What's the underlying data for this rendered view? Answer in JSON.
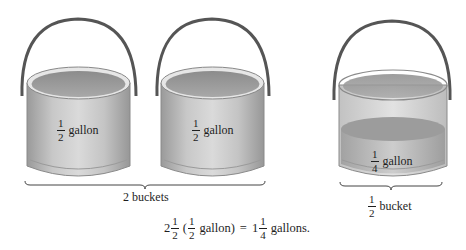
{
  "figure": {
    "buckets": [
      {
        "id": "bucket-1",
        "label": {
          "numerator": "1",
          "denominator": "2",
          "unit": "gallon"
        },
        "fill": "full"
      },
      {
        "id": "bucket-2",
        "label": {
          "numerator": "1",
          "denominator": "2",
          "unit": "gallon"
        },
        "fill": "full"
      },
      {
        "id": "bucket-3",
        "label": {
          "numerator": "1",
          "denominator": "4",
          "unit": "gallon"
        },
        "fill": "half"
      }
    ],
    "braces": [
      {
        "id": "brace-2-buckets",
        "text": "2 buckets"
      },
      {
        "id": "brace-half-bucket",
        "numerator": "1",
        "denominator": "2",
        "text": "bucket"
      }
    ],
    "equation": {
      "whole1": "2",
      "num1": "1",
      "den1": "2",
      "open": "(",
      "num2": "1",
      "den2": "2",
      "unit2": "gallon)",
      "equals": "=",
      "whole3": "1",
      "num3": "1",
      "den3": "4",
      "unit3": "gallons."
    },
    "colors": {
      "handle": "#555555",
      "bucket_light": "#d4d4d4",
      "bucket_mid": "#b5b5b5",
      "bucket_dark": "#8f8f8f",
      "water": "#a9a9a9",
      "brace": "#444444"
    }
  }
}
